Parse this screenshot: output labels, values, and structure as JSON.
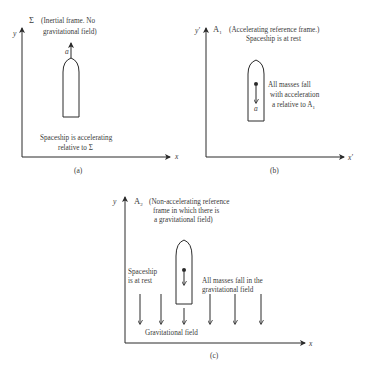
{
  "panels": {
    "a": {
      "caption": "(a)",
      "axis_y": "y",
      "axis_x": "x",
      "frame_symbol": "Σ",
      "frame_desc_line1": "(Inertial frame.  No",
      "frame_desc_line2": "gravitational field)",
      "accel_label": "a",
      "note_line1": "Spaceship is accelerating",
      "note_line2": "relative to Σ"
    },
    "b": {
      "caption": "(b)",
      "axis_y": "y'",
      "axis_x": "x'",
      "frame_symbol": "A",
      "frame_sub": "1",
      "frame_desc_line1": "(Accelerating reference frame.)",
      "frame_desc_line2": "Spaceship is at rest",
      "accel_label": "a",
      "note_line1": "All masses fall",
      "note_line2": "with acceleration",
      "note_line3_prefix": "a relative to A",
      "note_line3_sub": "1"
    },
    "c": {
      "caption": "(c)",
      "axis_y": "y",
      "axis_x": "x",
      "frame_symbol": "A",
      "frame_sub": "2",
      "frame_desc_line1": "(Non-accelerating reference",
      "frame_desc_line2": "frame in which there is",
      "frame_desc_line3": "a gravitational field)",
      "left_note_line1": "Spaceship",
      "left_note_line2": "is at rest",
      "right_note_line1": "All masses fall in the",
      "right_note_line2": "gravitational field",
      "field_label": "Gravitational field",
      "field_arrow_count": 6
    }
  }
}
